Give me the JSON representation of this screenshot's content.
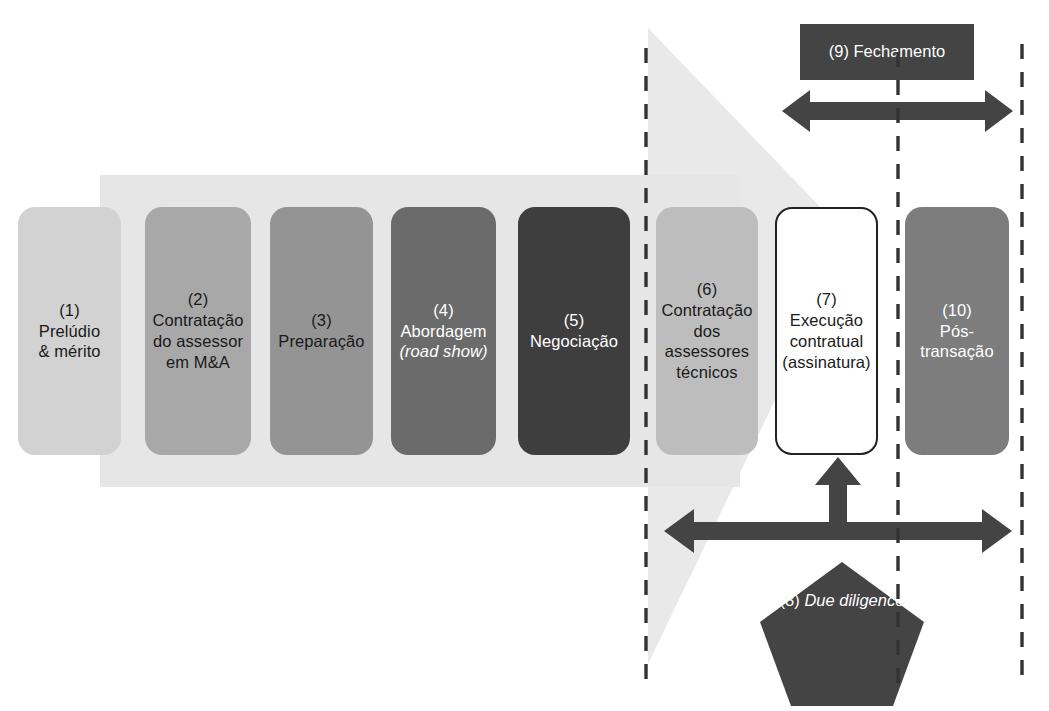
{
  "diagram": {
    "language": "pt-BR",
    "colors": {
      "band": "#e6e6e6",
      "wedge": "#e9e9e9",
      "dark_accent": "#444444",
      "dashed_line": "#333333",
      "box_text_dark": "#1a1a1a",
      "box_text_light": "#ffffff"
    }
  },
  "phases": [
    {
      "id": "phase-1",
      "number": "(1)",
      "lines": [
        "Prelúdio",
        "& mérito"
      ],
      "fill": "#d2d2d2",
      "text_color": "#1a1a1a",
      "border": "none",
      "x": 18,
      "y": 207,
      "w": 103,
      "h": 248
    },
    {
      "id": "phase-2",
      "number": "(2)",
      "lines": [
        "Contratação",
        "do assessor",
        "em  M&A"
      ],
      "fill": "#a8a8a8",
      "text_color": "#1a1a1a",
      "border": "none",
      "x": 145,
      "y": 207,
      "w": 106,
      "h": 248
    },
    {
      "id": "phase-3",
      "number": "(3)",
      "lines": [
        "Preparação"
      ],
      "fill": "#949494",
      "text_color": "#1a1a1a",
      "border": "none",
      "x": 270,
      "y": 207,
      "w": 103,
      "h": 248
    },
    {
      "id": "phase-4",
      "number": "(4)",
      "lines": [
        "Abordagem",
        "(road show)"
      ],
      "italic_line": 1,
      "italic_word": "road show",
      "fill": "#6b6b6b",
      "text_color": "#ffffff",
      "border": "none",
      "x": 391,
      "y": 207,
      "w": 105,
      "h": 248
    },
    {
      "id": "phase-5",
      "number": "(5)",
      "lines": [
        "Negociação"
      ],
      "fill": "#3e3e3e",
      "text_color": "#ffffff",
      "border": "none",
      "x": 518,
      "y": 207,
      "w": 112,
      "h": 248
    },
    {
      "id": "phase-6",
      "number": "(6)",
      "lines": [
        "Contratação",
        "dos",
        "assessores",
        "técnicos"
      ],
      "fill": "#bdbdbd",
      "text_color": "#1a1a1a",
      "border": "none",
      "x": 656,
      "y": 207,
      "w": 102,
      "h": 248
    },
    {
      "id": "phase-7",
      "number": "(7)",
      "lines": [
        "Execução",
        "contratual",
        "(assinatura)"
      ],
      "fill": "#ffffff",
      "text_color": "#1a1a1a",
      "border": "2px solid #222222",
      "x": 775,
      "y": 207,
      "w": 103,
      "h": 248
    },
    {
      "id": "phase-10",
      "number": "(10)",
      "lines": [
        "Pós-",
        "transação"
      ],
      "fill": "#7d7d7d",
      "text_color": "#ffffff",
      "border": "none",
      "x": 905,
      "y": 207,
      "w": 104,
      "h": 248
    }
  ],
  "callouts": [
    {
      "id": "callout-9",
      "number": "(9)",
      "lines": [
        "Fechamento"
      ],
      "fill": "#444444",
      "x": 800,
      "y": 24,
      "w": 174,
      "h": 56
    }
  ],
  "pentagon": {
    "id": "pentagon-8",
    "number": "(8)",
    "lines": [
      "Due",
      "diligence"
    ],
    "italic": true,
    "fill": "#444444",
    "x": 758,
    "y": 560,
    "w": 168,
    "h": 148
  },
  "dashed_lines": [
    {
      "id": "divider-1",
      "x": 646,
      "y1": 48,
      "y2": 686
    },
    {
      "id": "divider-2",
      "x": 898,
      "y1": 52,
      "y2": 686
    },
    {
      "id": "divider-3",
      "x": 1022,
      "y1": 44,
      "y2": 686
    }
  ],
  "arrows": [
    {
      "id": "arrow-fechamento",
      "orientation": "double-horizontal",
      "x1": 789,
      "x2": 1001,
      "y": 110,
      "thickness": 15
    },
    {
      "id": "arrow-duediligence-span",
      "orientation": "double-horizontal",
      "x1": 672,
      "x2": 1000,
      "y": 530,
      "thickness": 16
    },
    {
      "id": "arrow-duediligence-up",
      "orientation": "single-up",
      "x": 836,
      "y1": 462,
      "y2": 532,
      "thickness": 20
    }
  ],
  "background_shapes": [
    {
      "id": "process-band",
      "type": "rect",
      "x": 100,
      "y": 175,
      "w": 640,
      "h": 312,
      "fill": "#e6e6e6"
    },
    {
      "id": "transaction-wedge",
      "type": "triangle",
      "points": "648,28 852,240 648,664",
      "fill": "#e9e9e9"
    }
  ]
}
